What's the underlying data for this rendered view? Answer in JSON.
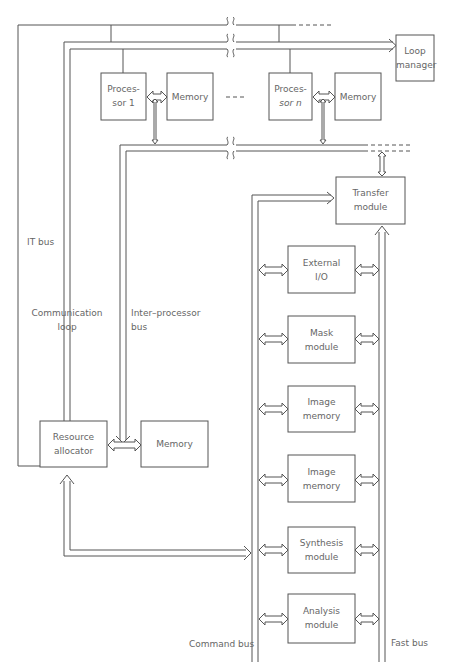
{
  "diagram": {
    "blocks": {
      "processor_1": "Proces-\nsor 1",
      "processor_1_line1": "Proces-",
      "processor_1_line2": "sor 1",
      "memory_1": "Memory",
      "processor_n_line1": "Proces-",
      "processor_n_line2": "sor n",
      "memory_n": "Memory",
      "loop_manager_line1": "Loop",
      "loop_manager_line2": "manager",
      "transfer_module_line1": "Transfer",
      "transfer_module_line2": "module",
      "external_io_line1": "External",
      "external_io_line2": "I/O",
      "mask_module_line1": "Mask",
      "mask_module_line2": "module",
      "image_memory_1_line1": "Image",
      "image_memory_1_line2": "memory",
      "image_memory_2_line1": "Image",
      "image_memory_2_line2": "memory",
      "synthesis_module_line1": "Synthesis",
      "synthesis_module_line2": "module",
      "analysis_module_line1": "Analysis",
      "analysis_module_line2": "module",
      "resource_allocator_line1": "Resource",
      "resource_allocator_line2": "allocator",
      "resource_memory": "Memory"
    },
    "bus_labels": {
      "it_bus": "IT bus",
      "communication_loop_line1": "Communication",
      "communication_loop_line2": "loop",
      "inter_processor_bus_line1": "Inter–processor",
      "inter_processor_bus_line2": "bus",
      "command_bus": "Command bus",
      "fast_bus": "Fast bus"
    },
    "ellipsis": "- - - -",
    "line_color": "#555555",
    "text_color": "#666666"
  }
}
